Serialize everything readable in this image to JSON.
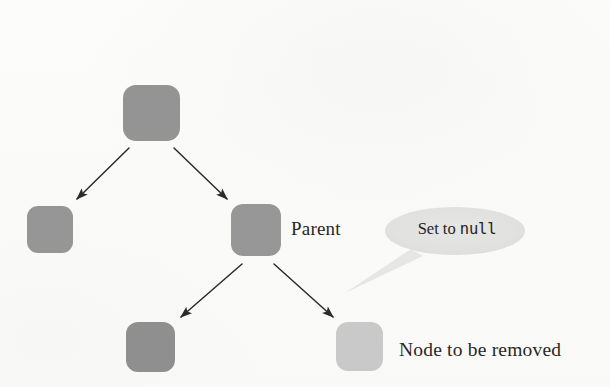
{
  "diagram": {
    "background_color": "#fbfbfa",
    "node_color": "#949494",
    "node_color_light": "#c9c9c9",
    "arrow_color": "#2b2b2b",
    "bubble_color": "#e2e2e0",
    "text_color": "#2a2724"
  },
  "nodes": [
    {
      "id": "root",
      "name": "root-node",
      "x": 123,
      "y": 85,
      "w": 57,
      "h": 56,
      "r": 13,
      "shade": "dark"
    },
    {
      "id": "left-child",
      "name": "left-child-node",
      "x": 27,
      "y": 206,
      "w": 46,
      "h": 47,
      "r": 11,
      "shade": "dark"
    },
    {
      "id": "parent",
      "name": "parent-node",
      "x": 231,
      "y": 204,
      "w": 50,
      "h": 52,
      "r": 12,
      "shade": "dark"
    },
    {
      "id": "sibling",
      "name": "sibling-node",
      "x": 126,
      "y": 322,
      "w": 49,
      "h": 50,
      "r": 12,
      "shade": "dark"
    },
    {
      "id": "removed",
      "name": "node-to-be-removed",
      "x": 336,
      "y": 322,
      "w": 47,
      "h": 49,
      "r": 12,
      "shade": "light"
    }
  ],
  "arrows": [
    {
      "name": "arrow-root-to-left-child",
      "x1": 129,
      "y1": 148,
      "x2": 77,
      "y2": 199
    },
    {
      "name": "arrow-root-to-parent",
      "x1": 174,
      "y1": 148,
      "x2": 227,
      "y2": 199
    },
    {
      "name": "arrow-parent-to-sibling",
      "x1": 242,
      "y1": 264,
      "x2": 181,
      "y2": 317
    },
    {
      "name": "arrow-parent-to-removed",
      "x1": 274,
      "y1": 264,
      "x2": 333,
      "y2": 317
    }
  ],
  "callout": {
    "name": "set-to-null-callout",
    "ellipse": {
      "cx": 455,
      "cy": 231,
      "rx": 70,
      "ry": 24
    },
    "tail": {
      "points": "411,249 423,256 345,293"
    },
    "text_prefix": "Set to ",
    "text_code": "null",
    "full_text": "Set to null"
  },
  "labels": {
    "parent": "Parent",
    "removed": "Node to be removed"
  }
}
